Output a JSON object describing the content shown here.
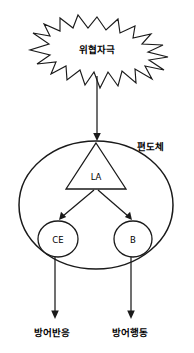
{
  "diagram": {
    "stimulus": {
      "label": "위협자극",
      "shape": "starburst"
    },
    "region": {
      "label": "편도체",
      "shape": "ellipse"
    },
    "nodes": [
      {
        "id": "LA",
        "label": "LA",
        "shape": "triangle"
      },
      {
        "id": "CE",
        "label": "CE",
        "shape": "circle"
      },
      {
        "id": "B",
        "label": "B",
        "shape": "circle"
      }
    ],
    "outputs": [
      {
        "id": "defensive-response",
        "label": "방어반응",
        "from": "CE"
      },
      {
        "id": "defensive-behavior",
        "label": "방어행동",
        "from": "B"
      }
    ],
    "colors": {
      "stroke": "#1a1a1a",
      "text": "#000000",
      "background": "#ffffff"
    }
  }
}
